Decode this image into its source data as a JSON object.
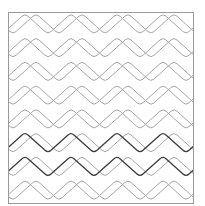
{
  "pattern": {
    "name": "zigzag-quilt-pattern",
    "frame": {
      "x": 8,
      "y": 12,
      "width": 185,
      "height": 191,
      "stroke": "#9a9a9a"
    },
    "rows": 8,
    "row_height": 23.75,
    "period": 46,
    "phase_x": 25,
    "strand_offset_x": 11,
    "corner_radius": 4,
    "colors": {
      "light": "#a6a6a6",
      "dark": "#3c3c3c"
    },
    "stroke_width": 1,
    "dark_rows": [
      5,
      6
    ]
  }
}
